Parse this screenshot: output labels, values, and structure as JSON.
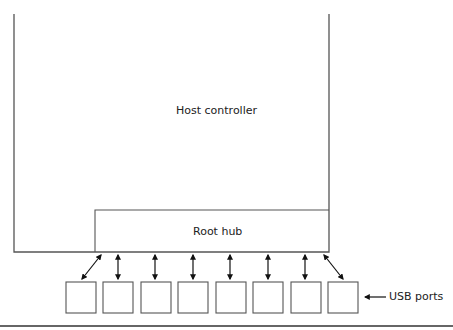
{
  "diagram": {
    "host_controller": {
      "label": "Host controller"
    },
    "root_hub": {
      "label": "Root hub"
    },
    "ports": {
      "label": "USB ports",
      "count": 8
    },
    "colors": {
      "stroke": "#555555",
      "arrow": "#111111",
      "background": "#ffffff"
    }
  }
}
